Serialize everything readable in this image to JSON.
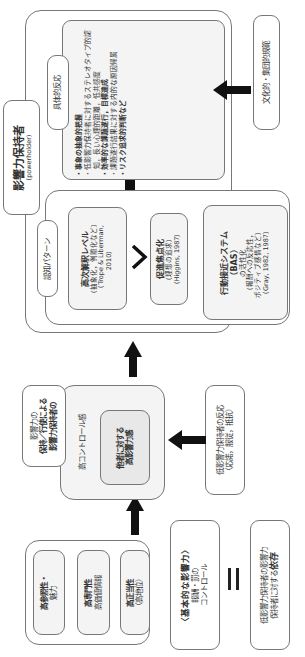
{
  "base_sources": {
    "items": [
      {
        "title": "高参照性・",
        "sub": "魅力"
      },
      {
        "title": "高専門性",
        "sub": "高価値情報"
      },
      {
        "title": "高正当性",
        "sub": "（高地位）"
      }
    ]
  },
  "basic_influence": {
    "title": "〈基本的な影響力〉",
    "line1": "報酬・罰の",
    "line2": "コントロール"
  },
  "equals_symbol": "=",
  "dependence": {
    "line1": "低影響力保持者の影響力",
    "line2_prefix": "保持者に対する",
    "line2_bold": "依存"
  },
  "control": {
    "label_line1": "影響力の",
    "label_line2": "保持／行使による",
    "label_line3": "影響力保持者の",
    "title": "高コントロール感",
    "inner_line1": "他者に対する",
    "inner_line2": "高影響力感"
  },
  "low_reaction": {
    "line1": "低影響力保持者の反応",
    "line2": "（応諾，服従，抵抗）"
  },
  "powerholder": {
    "title": "影響力保持者",
    "subtitle": "(powerholder)"
  },
  "cognitive": {
    "label": "認知パターン",
    "construal": {
      "title": "高次解釈レベル",
      "line1": "（抽象化，例離化など）",
      "line2": "（Trope & Liberman,",
      "line3": "2010）"
    },
    "chevron": ">",
    "promotion": {
      "title": "促進焦点化",
      "line1": "（理想の追求）",
      "line2": "（Higgins, 1987）"
    },
    "bas": {
      "title": "行動接近システム",
      "line1": "（BAS）",
      "line2": "の活性化",
      "line3": "（報酬への反応性，",
      "line4": "ポジティブ感情など）",
      "line5": "（Gray, 1982, 1987）"
    }
  },
  "concrete": {
    "label": "具体的反応",
    "items": [
      {
        "text": "事象の抽象的把握",
        "bold": true
      },
      {
        "text": "低影響力保持者に対する，ステレオタイプ的認知，",
        "bold": false
      },
      {
        "text": "低影響力保持者に対するステレオタイプ的認知，長い心理的距離，低共感度",
        "bold": false
      },
      {
        "text": "効率的な課題遂行，目標達成",
        "bold": true
      },
      {
        "text": "課題遂行結果に対する内的な原因帰属",
        "bold": false
      },
      {
        "text": "リスク追求的判断など",
        "bold": true
      }
    ]
  },
  "culture": {
    "label": "文化的・集団的規範"
  }
}
